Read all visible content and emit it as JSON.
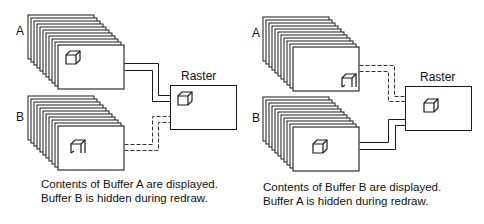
{
  "panels": [
    {
      "id": "left",
      "buffer_a_label": "A",
      "buffer_b_label": "B",
      "raster_label": "Raster",
      "displayed_buffer": "A",
      "caption_line1": "Contents of Buffer A are displayed.",
      "caption_line2": "Buffer B is hidden during redraw.",
      "buffer_a_icon": "cube-complete-icon",
      "buffer_b_icon": "cube-partial-icon",
      "raster_icon": "cube-complete-icon"
    },
    {
      "id": "right",
      "buffer_a_label": "A",
      "buffer_b_label": "B",
      "raster_label": "Raster",
      "displayed_buffer": "B",
      "caption_line1": "Contents of Buffer B are displayed.",
      "caption_line2": "Buffer A is hidden during redraw.",
      "buffer_a_icon": "cube-partial-icon",
      "buffer_b_icon": "cube-complete-icon",
      "raster_icon": "cube-complete-icon"
    }
  ],
  "colors": {
    "stroke": "#1a1a1a",
    "background": "#ffffff"
  }
}
